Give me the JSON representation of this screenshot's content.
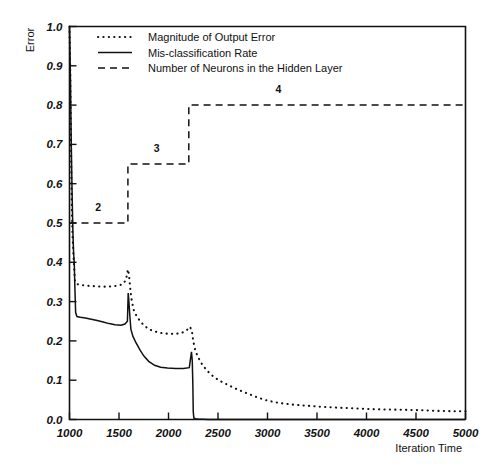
{
  "chart_data": {
    "type": "line",
    "title": "",
    "xlabel": "Iteration Time",
    "ylabel": "Error",
    "xlim": [
      1000,
      5000
    ],
    "ylim": [
      0.0,
      1.0
    ],
    "grid": false,
    "legend_position": "top-left-inside",
    "xticks": [
      1000,
      1500,
      2000,
      2500,
      3000,
      3500,
      4000,
      4500,
      5000
    ],
    "xtick_labels": [
      "1000",
      "1500",
      "2000",
      "2500",
      "3000",
      "3500",
      "4000",
      "4500",
      "5000"
    ],
    "yticks": [
      0.0,
      0.1,
      0.2,
      0.3,
      0.4,
      0.5,
      0.6,
      0.7,
      0.8,
      0.9,
      1.0
    ],
    "ytick_labels": [
      "0.0",
      "0.1",
      "0.2",
      "0.3",
      "0.4",
      "0.5",
      "0.6",
      "0.7",
      "0.8",
      "0.9",
      "1.0"
    ],
    "series": [
      {
        "name": "Magnitude of Output Error",
        "style": "dotted",
        "color": "#111111",
        "points": [
          [
            1000,
            1.0
          ],
          [
            1008,
            0.88
          ],
          [
            1015,
            0.7
          ],
          [
            1022,
            0.56
          ],
          [
            1030,
            0.47
          ],
          [
            1038,
            0.43
          ],
          [
            1046,
            0.39
          ],
          [
            1055,
            0.352
          ],
          [
            1070,
            0.345
          ],
          [
            1100,
            0.343
          ],
          [
            1150,
            0.341
          ],
          [
            1200,
            0.34
          ],
          [
            1260,
            0.339
          ],
          [
            1320,
            0.338
          ],
          [
            1380,
            0.338
          ],
          [
            1440,
            0.339
          ],
          [
            1500,
            0.341
          ],
          [
            1540,
            0.345
          ],
          [
            1570,
            0.355
          ],
          [
            1590,
            0.382
          ],
          [
            1600,
            0.37
          ],
          [
            1615,
            0.33
          ],
          [
            1630,
            0.3
          ],
          [
            1650,
            0.278
          ],
          [
            1680,
            0.262
          ],
          [
            1720,
            0.248
          ],
          [
            1760,
            0.238
          ],
          [
            1800,
            0.23
          ],
          [
            1860,
            0.224
          ],
          [
            1930,
            0.22
          ],
          [
            2000,
            0.218
          ],
          [
            2070,
            0.218
          ],
          [
            2130,
            0.22
          ],
          [
            2180,
            0.226
          ],
          [
            2215,
            0.236
          ],
          [
            2235,
            0.228
          ],
          [
            2250,
            0.2
          ],
          [
            2270,
            0.176
          ],
          [
            2300,
            0.158
          ],
          [
            2340,
            0.14
          ],
          [
            2390,
            0.124
          ],
          [
            2450,
            0.11
          ],
          [
            2520,
            0.098
          ],
          [
            2600,
            0.088
          ],
          [
            2700,
            0.076
          ],
          [
            2800,
            0.066
          ],
          [
            2900,
            0.056
          ],
          [
            3000,
            0.048
          ],
          [
            3120,
            0.042
          ],
          [
            3250,
            0.038
          ],
          [
            3400,
            0.035
          ],
          [
            3560,
            0.032
          ],
          [
            3720,
            0.03
          ],
          [
            3900,
            0.028
          ],
          [
            4100,
            0.026
          ],
          [
            4300,
            0.025
          ],
          [
            4500,
            0.024
          ],
          [
            4700,
            0.022
          ],
          [
            4900,
            0.021
          ],
          [
            5000,
            0.021
          ]
        ]
      },
      {
        "name": "Mis-classification Rate",
        "style": "solid",
        "color": "#111111",
        "points": [
          [
            1000,
            1.0
          ],
          [
            1010,
            0.86
          ],
          [
            1018,
            0.7
          ],
          [
            1026,
            0.58
          ],
          [
            1034,
            0.48
          ],
          [
            1042,
            0.42
          ],
          [
            1048,
            0.4
          ],
          [
            1055,
            0.33
          ],
          [
            1062,
            0.272
          ],
          [
            1075,
            0.262
          ],
          [
            1110,
            0.26
          ],
          [
            1160,
            0.258
          ],
          [
            1220,
            0.255
          ],
          [
            1280,
            0.252
          ],
          [
            1340,
            0.248
          ],
          [
            1400,
            0.244
          ],
          [
            1460,
            0.241
          ],
          [
            1520,
            0.24
          ],
          [
            1560,
            0.243
          ],
          [
            1585,
            0.25
          ],
          [
            1593,
            0.322
          ],
          [
            1600,
            0.3
          ],
          [
            1610,
            0.262
          ],
          [
            1620,
            0.23
          ],
          [
            1640,
            0.212
          ],
          [
            1670,
            0.196
          ],
          [
            1710,
            0.178
          ],
          [
            1750,
            0.162
          ],
          [
            1800,
            0.148
          ],
          [
            1860,
            0.138
          ],
          [
            1920,
            0.133
          ],
          [
            1990,
            0.131
          ],
          [
            2070,
            0.13
          ],
          [
            2150,
            0.13
          ],
          [
            2210,
            0.132
          ],
          [
            2232,
            0.172
          ],
          [
            2240,
            0.15
          ],
          [
            2246,
            0.09
          ],
          [
            2250,
            0.02
          ],
          [
            2256,
            0.004
          ],
          [
            2270,
            0.002
          ],
          [
            2300,
            0.001
          ],
          [
            2400,
            0.0
          ],
          [
            5000,
            0.0
          ]
        ]
      },
      {
        "name": "Number of Neurons in the Hidden Layer",
        "style": "dashed",
        "color": "#111111",
        "points": [
          [
            1000,
            0.5
          ],
          [
            1590,
            0.5
          ],
          [
            1590,
            0.65
          ],
          [
            2205,
            0.65
          ],
          [
            2205,
            0.8
          ],
          [
            5000,
            0.8
          ]
        ],
        "step_annotations": [
          {
            "label": "2",
            "x": 1290,
            "y": 0.53
          },
          {
            "label": "3",
            "x": 1880,
            "y": 0.68
          },
          {
            "label": "4",
            "x": 3110,
            "y": 0.832
          }
        ]
      }
    ]
  },
  "legend": {
    "entries": [
      {
        "label": "Magnitude of Output Error",
        "style": "dotted"
      },
      {
        "label": "Mis-classification Rate",
        "style": "solid"
      },
      {
        "label": "Number of Neurons in the Hidden Layer",
        "style": "dashed"
      }
    ]
  }
}
